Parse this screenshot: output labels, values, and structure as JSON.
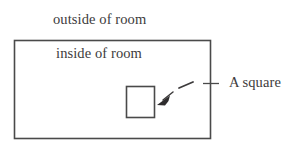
{
  "diagram": {
    "type": "geometric-figure",
    "background_color": "#ffffff",
    "stroke_color": "#4a4a4a",
    "text_color": "#3d3b3c",
    "labels": {
      "outside": "outside of room",
      "inside": "inside of room",
      "callout": "A square"
    },
    "shapes": [
      {
        "name": "room-rectangle",
        "kind": "rectangle",
        "x": 14,
        "y": 40,
        "width": 197,
        "height": 99
      },
      {
        "name": "inner-square",
        "kind": "square",
        "x": 126,
        "y": 86,
        "width": 29,
        "height": 32
      }
    ],
    "annotation": {
      "name": "callout-arrow",
      "style": "dashed",
      "arrowhead": "filled-triangle",
      "points_to": "inner-square",
      "from_x": 211,
      "from_y": 83,
      "to_x": 159,
      "to_y": 104,
      "tick_mark": "cross-tick-on-right-wall"
    }
  }
}
